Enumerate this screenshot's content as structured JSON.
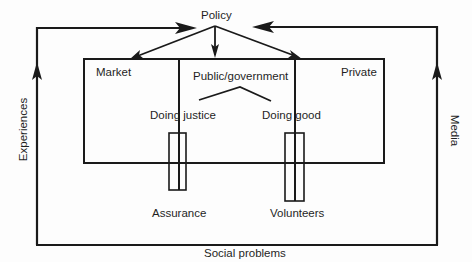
{
  "diagram": {
    "type": "flow-diagram",
    "nodes": {
      "policy": "Policy",
      "market": "Market",
      "public_government": "Public/government",
      "private": "Private",
      "doing_justice": "Doing justice",
      "doing_good": "Doing good",
      "assurance": "Assurance",
      "volunteers": "Volunteers"
    },
    "loop_labels": {
      "left": "Experiences",
      "right": "Media",
      "bottom": "Social problems"
    },
    "edges": [
      {
        "from": "social_problems",
        "to": "policy",
        "via": "Experiences"
      },
      {
        "from": "social_problems",
        "to": "policy",
        "via": "Media"
      },
      {
        "from": "policy",
        "to": "market"
      },
      {
        "from": "policy",
        "to": "public_government"
      },
      {
        "from": "policy",
        "to": "private"
      }
    ],
    "colors": {
      "line": "#1a1a1a",
      "background": "#fdfdfd"
    }
  }
}
